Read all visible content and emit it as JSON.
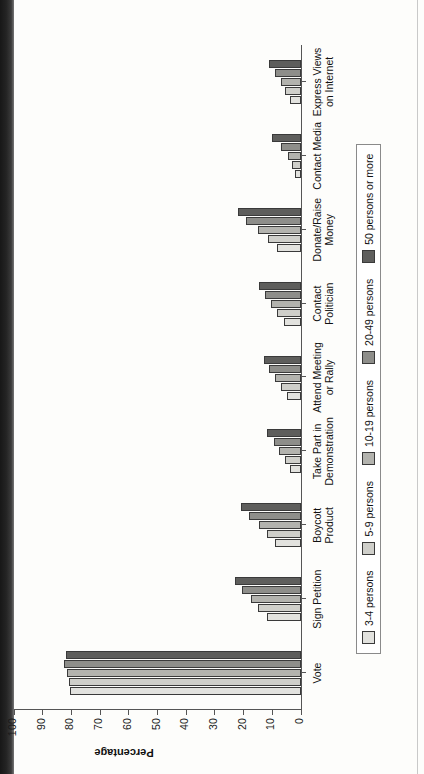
{
  "chart_data": {
    "type": "bar",
    "title": "",
    "xlabel": "",
    "ylabel": "Percentage",
    "ylim": [
      0,
      100
    ],
    "yticks": [
      0,
      10,
      20,
      30,
      40,
      50,
      60,
      70,
      80,
      90,
      100
    ],
    "grid": false,
    "orientation": "vertical-bars-in-rotated-page",
    "legend_position": "bottom",
    "categories": [
      "Vote",
      "Sign Petition",
      "Boycott Product",
      "Take Part in\nDemonstration",
      "Attend Meeting\nor Rally",
      "Contact\nPolitician",
      "Donate/Raise\nMoney",
      "Contact Media",
      "Express Views\non Internet"
    ],
    "series": [
      {
        "name": "3-4 persons",
        "color": "#e2e2de",
        "values": [
          80.5,
          12.0,
          9.0,
          4.0,
          5.0,
          6.0,
          8.5,
          2.0,
          4.0
        ]
      },
      {
        "name": "5-9 persons",
        "color": "#cfcfca",
        "values": [
          81.0,
          15.0,
          12.0,
          5.5,
          7.0,
          8.5,
          11.5,
          3.0,
          5.5
        ]
      },
      {
        "name": "10-19 persons",
        "color": "#b3b3ae",
        "values": [
          81.5,
          17.5,
          14.5,
          7.5,
          9.0,
          10.5,
          15.0,
          4.5,
          7.0
        ]
      },
      {
        "name": "20-49 persons",
        "color": "#8e8e8a",
        "values": [
          82.5,
          20.5,
          18.0,
          9.5,
          11.0,
          12.5,
          19.0,
          7.0,
          9.0
        ]
      },
      {
        "name": "50 persons or more",
        "color": "#5e5e5c",
        "values": [
          82.0,
          23.0,
          21.0,
          12.0,
          13.0,
          14.5,
          22.0,
          10.0,
          11.0
        ]
      }
    ]
  },
  "axis": {
    "y_title": "Percentage"
  }
}
